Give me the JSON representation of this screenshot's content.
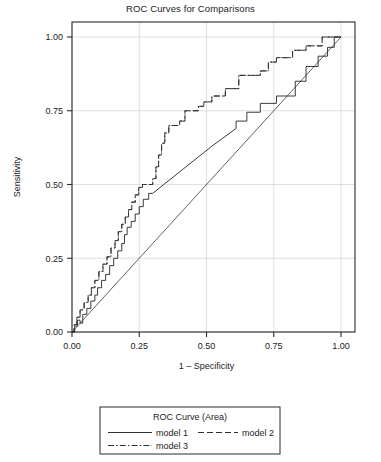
{
  "chart_data": {
    "type": "line",
    "title": "ROC Curves for Comparisons",
    "xlabel": "1 – Specificity",
    "ylabel": "Sensitivity",
    "xlim": [
      0,
      1
    ],
    "ylim": [
      0,
      1
    ],
    "xticks": [
      "0.00",
      "0.25",
      "0.50",
      "0.75",
      "1.00"
    ],
    "yticks": [
      "0.00",
      "0.25",
      "0.50",
      "0.75",
      "1.00"
    ],
    "xtick_values": [
      0,
      0.25,
      0.5,
      0.75,
      1
    ],
    "ytick_values": [
      0,
      0.25,
      0.5,
      0.75,
      1
    ],
    "grid": true,
    "legend_position": "below",
    "legend_title": "ROC Curve (Area)",
    "reference_line": {
      "name": "reference-diagonal",
      "x": [
        0,
        1
      ],
      "y": [
        0,
        1
      ],
      "style": "solid"
    },
    "series": [
      {
        "name": "model 1",
        "style": "solid",
        "points": [
          [
            0.0,
            0.0
          ],
          [
            0.01,
            0.0
          ],
          [
            0.01,
            0.02
          ],
          [
            0.02,
            0.02
          ],
          [
            0.02,
            0.04
          ],
          [
            0.03,
            0.04
          ],
          [
            0.03,
            0.03
          ],
          [
            0.04,
            0.03
          ],
          [
            0.04,
            0.06
          ],
          [
            0.055,
            0.06
          ],
          [
            0.055,
            0.08
          ],
          [
            0.07,
            0.08
          ],
          [
            0.07,
            0.105
          ],
          [
            0.085,
            0.105
          ],
          [
            0.085,
            0.125
          ],
          [
            0.095,
            0.125
          ],
          [
            0.095,
            0.15
          ],
          [
            0.11,
            0.15
          ],
          [
            0.11,
            0.175
          ],
          [
            0.125,
            0.175
          ],
          [
            0.125,
            0.195
          ],
          [
            0.14,
            0.195
          ],
          [
            0.14,
            0.225
          ],
          [
            0.155,
            0.225
          ],
          [
            0.155,
            0.25
          ],
          [
            0.17,
            0.25
          ],
          [
            0.17,
            0.275
          ],
          [
            0.185,
            0.275
          ],
          [
            0.185,
            0.3
          ],
          [
            0.195,
            0.3
          ],
          [
            0.195,
            0.33
          ],
          [
            0.205,
            0.33
          ],
          [
            0.205,
            0.355
          ],
          [
            0.22,
            0.355
          ],
          [
            0.22,
            0.375
          ],
          [
            0.235,
            0.375
          ],
          [
            0.235,
            0.4
          ],
          [
            0.25,
            0.4
          ],
          [
            0.25,
            0.425
          ],
          [
            0.265,
            0.425
          ],
          [
            0.265,
            0.45
          ],
          [
            0.285,
            0.45
          ],
          [
            0.285,
            0.47
          ],
          [
            0.3,
            0.47
          ],
          [
            0.52,
            0.63
          ],
          [
            0.61,
            0.69
          ],
          [
            0.61,
            0.715
          ],
          [
            0.65,
            0.715
          ],
          [
            0.65,
            0.745
          ],
          [
            0.7,
            0.745
          ],
          [
            0.7,
            0.775
          ],
          [
            0.76,
            0.775
          ],
          [
            0.76,
            0.8
          ],
          [
            0.83,
            0.8
          ],
          [
            0.83,
            0.85
          ],
          [
            0.87,
            0.85
          ],
          [
            0.87,
            0.9
          ],
          [
            0.915,
            0.9
          ],
          [
            0.915,
            0.935
          ],
          [
            0.95,
            0.935
          ],
          [
            0.95,
            0.965
          ],
          [
            0.975,
            0.965
          ],
          [
            0.975,
            1.0
          ],
          [
            1.0,
            1.0
          ]
        ]
      },
      {
        "name": "model 2",
        "style": "dashed",
        "points": [
          [
            0.0,
            0.0
          ],
          [
            0.008,
            0.0
          ],
          [
            0.008,
            0.025
          ],
          [
            0.018,
            0.025
          ],
          [
            0.018,
            0.05
          ],
          [
            0.03,
            0.05
          ],
          [
            0.03,
            0.075
          ],
          [
            0.045,
            0.075
          ],
          [
            0.045,
            0.1
          ],
          [
            0.06,
            0.1
          ],
          [
            0.06,
            0.125
          ],
          [
            0.072,
            0.125
          ],
          [
            0.072,
            0.15
          ],
          [
            0.085,
            0.15
          ],
          [
            0.085,
            0.175
          ],
          [
            0.1,
            0.175
          ],
          [
            0.1,
            0.205
          ],
          [
            0.115,
            0.205
          ],
          [
            0.115,
            0.23
          ],
          [
            0.13,
            0.23
          ],
          [
            0.13,
            0.255
          ],
          [
            0.145,
            0.255
          ],
          [
            0.145,
            0.285
          ],
          [
            0.16,
            0.285
          ],
          [
            0.16,
            0.31
          ],
          [
            0.172,
            0.31
          ],
          [
            0.172,
            0.34
          ],
          [
            0.185,
            0.34
          ],
          [
            0.185,
            0.365
          ],
          [
            0.198,
            0.365
          ],
          [
            0.198,
            0.39
          ],
          [
            0.21,
            0.39
          ],
          [
            0.21,
            0.415
          ],
          [
            0.222,
            0.415
          ],
          [
            0.222,
            0.44
          ],
          [
            0.235,
            0.44
          ],
          [
            0.235,
            0.465
          ],
          [
            0.248,
            0.465
          ],
          [
            0.248,
            0.49
          ],
          [
            0.262,
            0.49
          ],
          [
            0.262,
            0.5
          ],
          [
            0.3,
            0.5
          ],
          [
            0.3,
            0.52
          ],
          [
            0.312,
            0.52
          ],
          [
            0.312,
            0.56
          ],
          [
            0.322,
            0.56
          ],
          [
            0.322,
            0.6
          ],
          [
            0.333,
            0.6
          ],
          [
            0.333,
            0.64
          ],
          [
            0.345,
            0.64
          ],
          [
            0.345,
            0.675
          ],
          [
            0.36,
            0.675
          ],
          [
            0.36,
            0.7
          ],
          [
            0.4,
            0.7
          ],
          [
            0.4,
            0.715
          ],
          [
            0.42,
            0.715
          ],
          [
            0.42,
            0.75
          ],
          [
            0.47,
            0.75
          ],
          [
            0.47,
            0.765
          ],
          [
            0.49,
            0.765
          ],
          [
            0.49,
            0.78
          ],
          [
            0.52,
            0.78
          ],
          [
            0.52,
            0.8
          ],
          [
            0.57,
            0.8
          ],
          [
            0.57,
            0.825
          ],
          [
            0.62,
            0.825
          ],
          [
            0.62,
            0.87
          ],
          [
            0.7,
            0.87
          ],
          [
            0.7,
            0.885
          ],
          [
            0.73,
            0.885
          ],
          [
            0.73,
            0.915
          ],
          [
            0.76,
            0.915
          ],
          [
            0.76,
            0.93
          ],
          [
            0.82,
            0.93
          ],
          [
            0.82,
            0.955
          ],
          [
            0.87,
            0.955
          ],
          [
            0.87,
            0.97
          ],
          [
            0.93,
            0.97
          ],
          [
            0.93,
            1.0
          ],
          [
            1.0,
            1.0
          ]
        ]
      },
      {
        "name": "model 3",
        "style": "dashdot",
        "points": [
          [
            0.0,
            0.0
          ],
          [
            0.008,
            0.0
          ],
          [
            0.008,
            0.025
          ],
          [
            0.018,
            0.025
          ],
          [
            0.018,
            0.05
          ],
          [
            0.03,
            0.05
          ],
          [
            0.03,
            0.075
          ],
          [
            0.045,
            0.075
          ],
          [
            0.045,
            0.1
          ],
          [
            0.06,
            0.1
          ],
          [
            0.06,
            0.125
          ],
          [
            0.072,
            0.125
          ],
          [
            0.072,
            0.15
          ],
          [
            0.085,
            0.15
          ],
          [
            0.085,
            0.175
          ],
          [
            0.1,
            0.175
          ],
          [
            0.1,
            0.205
          ],
          [
            0.115,
            0.205
          ],
          [
            0.115,
            0.23
          ],
          [
            0.13,
            0.23
          ],
          [
            0.13,
            0.255
          ],
          [
            0.145,
            0.255
          ],
          [
            0.145,
            0.285
          ],
          [
            0.16,
            0.285
          ],
          [
            0.16,
            0.31
          ],
          [
            0.172,
            0.31
          ],
          [
            0.172,
            0.34
          ],
          [
            0.185,
            0.34
          ],
          [
            0.185,
            0.365
          ],
          [
            0.198,
            0.365
          ],
          [
            0.198,
            0.39
          ],
          [
            0.21,
            0.39
          ],
          [
            0.21,
            0.415
          ],
          [
            0.222,
            0.415
          ],
          [
            0.222,
            0.44
          ],
          [
            0.235,
            0.44
          ],
          [
            0.235,
            0.465
          ],
          [
            0.248,
            0.465
          ],
          [
            0.248,
            0.49
          ],
          [
            0.262,
            0.49
          ],
          [
            0.262,
            0.5
          ],
          [
            0.3,
            0.5
          ],
          [
            0.3,
            0.52
          ],
          [
            0.312,
            0.52
          ],
          [
            0.312,
            0.56
          ],
          [
            0.322,
            0.56
          ],
          [
            0.322,
            0.6
          ],
          [
            0.333,
            0.6
          ],
          [
            0.333,
            0.64
          ],
          [
            0.345,
            0.64
          ],
          [
            0.345,
            0.675
          ],
          [
            0.36,
            0.675
          ],
          [
            0.36,
            0.7
          ],
          [
            0.4,
            0.7
          ],
          [
            0.4,
            0.715
          ],
          [
            0.42,
            0.715
          ],
          [
            0.42,
            0.75
          ],
          [
            0.47,
            0.75
          ],
          [
            0.47,
            0.765
          ],
          [
            0.49,
            0.765
          ],
          [
            0.49,
            0.78
          ],
          [
            0.52,
            0.78
          ],
          [
            0.52,
            0.8
          ],
          [
            0.57,
            0.8
          ],
          [
            0.57,
            0.825
          ],
          [
            0.62,
            0.825
          ],
          [
            0.62,
            0.87
          ],
          [
            0.7,
            0.87
          ],
          [
            0.7,
            0.885
          ],
          [
            0.73,
            0.885
          ],
          [
            0.73,
            0.915
          ],
          [
            0.76,
            0.915
          ],
          [
            0.76,
            0.93
          ],
          [
            0.82,
            0.93
          ],
          [
            0.82,
            0.955
          ],
          [
            0.87,
            0.955
          ],
          [
            0.87,
            0.97
          ],
          [
            0.93,
            0.97
          ],
          [
            0.93,
            1.0
          ],
          [
            1.0,
            1.0
          ]
        ]
      }
    ]
  },
  "legend": {
    "title": "ROC Curve (Area)",
    "entries": [
      {
        "label": "model 1",
        "style": "solid"
      },
      {
        "label": "model 2",
        "style": "dashed"
      },
      {
        "label": "model 3",
        "style": "dashdot"
      }
    ]
  }
}
